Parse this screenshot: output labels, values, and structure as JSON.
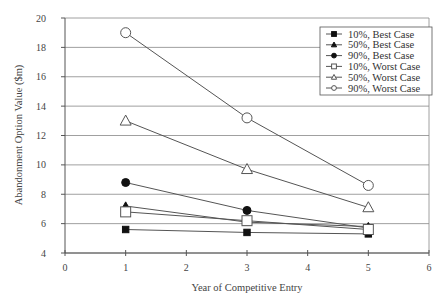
{
  "chart_data": {
    "type": "line",
    "title": "",
    "xlabel": "Year of Competitive Entry",
    "ylabel": "Abandonment Option Value ($m)",
    "x": [
      1,
      3,
      5
    ],
    "xlim": [
      0,
      6
    ],
    "ylim": [
      4,
      20
    ],
    "xticks": [
      0,
      1,
      2,
      3,
      4,
      5,
      6
    ],
    "yticks": [
      4,
      6,
      8,
      10,
      12,
      14,
      16,
      18,
      20
    ],
    "grid": {
      "horizontal": true,
      "vertical": false
    },
    "legend_position": "upper-right",
    "series": [
      {
        "name": "10%, Best Case",
        "marker": "filled-square",
        "values": [
          5.6,
          5.4,
          5.3
        ]
      },
      {
        "name": "50%, Best Case",
        "marker": "filled-triangle",
        "values": [
          7.2,
          6.1,
          5.8
        ]
      },
      {
        "name": "90%, Best Case",
        "marker": "filled-circle",
        "values": [
          8.8,
          6.9,
          5.7
        ]
      },
      {
        "name": "10%, Worst Case",
        "marker": "open-square",
        "values": [
          6.8,
          6.2,
          5.6
        ]
      },
      {
        "name": "50%, Worst Case",
        "marker": "open-triangle",
        "values": [
          13.0,
          9.7,
          7.1
        ]
      },
      {
        "name": "90%, Worst Case",
        "marker": "open-circle",
        "values": [
          19.0,
          13.2,
          8.6
        ]
      }
    ]
  },
  "colors": {
    "line": "#555555",
    "grid": "#888888",
    "axis": "#555555",
    "marker_fill": "#111111"
  }
}
